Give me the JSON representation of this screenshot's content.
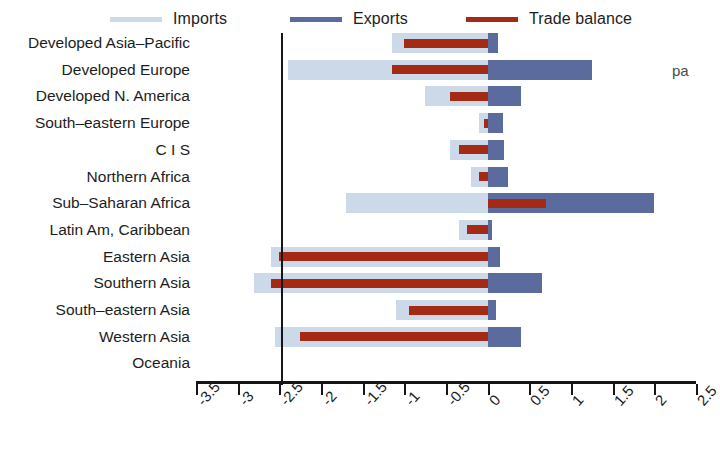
{
  "chart_data": {
    "type": "bar",
    "orientation": "horizontal",
    "title": "",
    "xlabel": "",
    "ylabel": "",
    "xlim": [
      -3.5,
      2.5
    ],
    "xticks": [
      "-3.5",
      "-3",
      "-2.5",
      "-2",
      "-1.5",
      "-1",
      "-0.5",
      "0",
      "0.5",
      "1",
      "1.5",
      "2",
      "2.5"
    ],
    "xtick_values": [
      -3.5,
      -3,
      -2.5,
      -2,
      -1.5,
      -1,
      -0.5,
      0,
      0.5,
      1,
      1.5,
      2,
      2.5
    ],
    "grid": false,
    "legend_position": "top",
    "categories": [
      "Developed Asia–Pacific",
      "Developed Europe",
      "Developed N. America",
      "South–eastern Europe",
      "C I S",
      "Northern Africa",
      "Sub–Saharan Africa",
      "Latin Am, Caribbean",
      "Eastern Asia",
      "Southern Asia",
      "South–eastern Asia",
      "Western Asia",
      "Oceania"
    ],
    "series": [
      {
        "name": "Imports",
        "color": "#ccd9e8",
        "values": [
          -1.15,
          -2.4,
          -0.75,
          -0.1,
          -0.45,
          -0.2,
          -1.7,
          -0.35,
          -2.6,
          -2.8,
          -1.1,
          -2.55,
          0
        ]
      },
      {
        "name": "Exports",
        "color": "#5c6b9e",
        "values": [
          0.12,
          1.25,
          0.4,
          0.18,
          0.2,
          0.25,
          2.0,
          0.05,
          0.15,
          0.65,
          0.1,
          0.4,
          0
        ]
      },
      {
        "name": "Trade balance",
        "color": "#a52a16",
        "values": [
          -1.0,
          -1.15,
          -0.45,
          -0.05,
          -0.35,
          -0.1,
          0.7,
          -0.25,
          -2.5,
          -2.6,
          -0.95,
          -2.25,
          0
        ]
      }
    ]
  },
  "legend": {
    "items": [
      {
        "label": "Imports",
        "color": "#ccd9e8"
      },
      {
        "label": "Exports",
        "color": "#5c6b9e"
      },
      {
        "label": "Trade balance",
        "color": "#a52a16"
      }
    ]
  },
  "clipped_header_text": "",
  "side_note": "pa"
}
